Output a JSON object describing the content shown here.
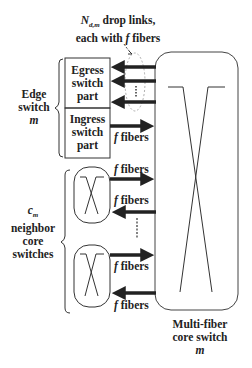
{
  "annotation": {
    "line1_symbol": "N",
    "line1_subscript": "d,m",
    "line1_rest": " drop links,",
    "line2": "each with ",
    "line2_italic": "f",
    "line2_rest": " fibers"
  },
  "edge_switch": {
    "label_line1": "Edge",
    "label_line2": "switch",
    "label_line3": "m",
    "egress": [
      "Egress",
      "switch",
      "part"
    ],
    "ingress": [
      "Ingress",
      "switch",
      "part"
    ]
  },
  "neighbors": {
    "count_symbol": "c",
    "count_subscript": "m",
    "label_line1": "neighbor",
    "label_line2": "core",
    "label_line3": "switches"
  },
  "fiber_label": {
    "italic": "f",
    "rest": " fibers"
  },
  "core_switch": {
    "label_line1": "Multi-fiber",
    "label_line2": "core switch",
    "label_line3": "m"
  },
  "colors": {
    "line": "#222222",
    "dashed": "#888888",
    "background": "#ffffff"
  }
}
